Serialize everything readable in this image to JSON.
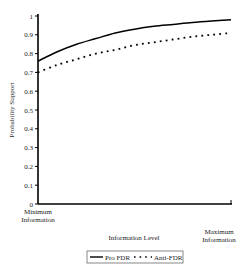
{
  "chart_data": {
    "type": "line",
    "title": "",
    "xlabel": "Information Level",
    "ylabel": "Probability Support",
    "ylim": [
      0,
      1
    ],
    "xlim": [
      0,
      1
    ],
    "yticks": [
      "0",
      "0.1",
      "0.2",
      "0.3",
      "0.4",
      "0.5",
      "0.6",
      "0.7",
      "0.8",
      "0.9",
      "1"
    ],
    "xtick_labels": {
      "min_line1": "Minimum",
      "min_line2": "Information",
      "max_line1": "Maximum",
      "max_line2": "Information"
    },
    "grid": false,
    "legend_position": "bottom",
    "series": [
      {
        "name": "Pro FDR",
        "style": "solid",
        "x": [
          0,
          0.1,
          0.2,
          0.3,
          0.4,
          0.5,
          0.6,
          0.7,
          0.8,
          0.9,
          1.0
        ],
        "values": [
          0.76,
          0.81,
          0.85,
          0.88,
          0.91,
          0.93,
          0.945,
          0.955,
          0.965,
          0.973,
          0.98
        ]
      },
      {
        "name": "Anti-FDR",
        "style": "dotted",
        "x": [
          0,
          0.1,
          0.2,
          0.3,
          0.4,
          0.5,
          0.6,
          0.7,
          0.8,
          0.9,
          1.0
        ],
        "values": [
          0.7,
          0.74,
          0.77,
          0.8,
          0.82,
          0.845,
          0.86,
          0.875,
          0.89,
          0.9,
          0.91
        ]
      }
    ]
  }
}
